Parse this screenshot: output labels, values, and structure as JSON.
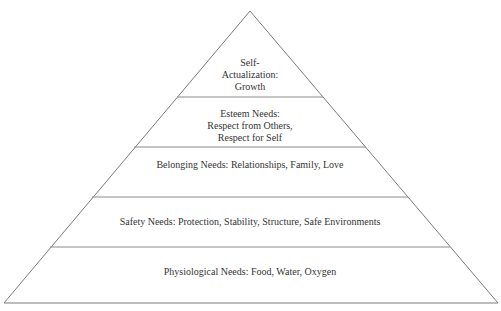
{
  "diagram": {
    "type": "pyramid",
    "title": "",
    "colors": {
      "outline": "#7a7a7a",
      "text": "#333333",
      "fill": "#ffffff"
    },
    "levels": [
      {
        "order": 5,
        "name": "Self-Actualization",
        "lines": [
          "Self-",
          "Actualization:",
          "Growth"
        ]
      },
      {
        "order": 4,
        "name": "Esteem Needs",
        "lines": [
          "Esteem Needs:",
          "Respect from Others,",
          "Respect for Self"
        ]
      },
      {
        "order": 3,
        "name": "Belonging Needs",
        "lines": [
          "Belonging Needs: Relationships, Family, Love"
        ]
      },
      {
        "order": 2,
        "name": "Safety Needs",
        "lines": [
          "Safety Needs: Protection, Stability, Structure, Safe Environments"
        ]
      },
      {
        "order": 1,
        "name": "Physiological Needs",
        "lines": [
          "Physiological Needs: Food, Water, Oxygen"
        ]
      }
    ]
  }
}
